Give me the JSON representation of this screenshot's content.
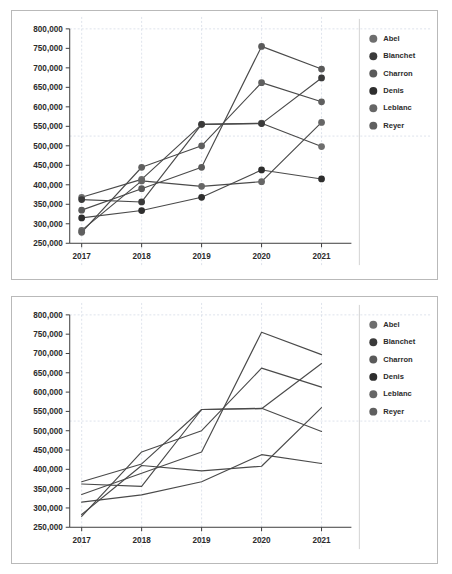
{
  "chart_data": [
    {
      "id": "top",
      "type": "line",
      "title": "",
      "xlabel": "",
      "ylabel": "",
      "marker_style": "circle",
      "markers_visible": true,
      "grid": true,
      "legend_position": "right",
      "categories": [
        "2017",
        "2018",
        "2019",
        "2020",
        "2021"
      ],
      "ylim": [
        250000,
        800000
      ],
      "yticks": [
        250000,
        300000,
        350000,
        400000,
        450000,
        500000,
        550000,
        600000,
        650000,
        700000,
        750000,
        800000
      ],
      "ytick_labels": [
        "250,000",
        "300,000",
        "350,000",
        "400,000",
        "450,000",
        "500,000",
        "550,000",
        "600,000",
        "650,000",
        "700,000",
        "750,000",
        "800,000"
      ],
      "series": [
        {
          "name": "Abel",
          "color": "#6e6e6e",
          "values": [
            368000,
            414000,
            555000,
            558000,
            498000
          ]
        },
        {
          "name": "Blanchet",
          "color": "#3a3a3a",
          "values": [
            362000,
            356000,
            555000,
            557000,
            674000
          ]
        },
        {
          "name": "Charron",
          "color": "#5a5a5a",
          "values": [
            335000,
            390000,
            445000,
            755000,
            697000
          ]
        },
        {
          "name": "Denis",
          "color": "#2e2e2e",
          "values": [
            315000,
            334000,
            368000,
            438000,
            415000
          ]
        },
        {
          "name": "Leblanc",
          "color": "#666666",
          "values": [
            283000,
            410000,
            396000,
            408000,
            560000
          ]
        },
        {
          "name": "Reyer",
          "color": "#5f5f5f",
          "values": [
            278000,
            445000,
            500000,
            662000,
            613000
          ]
        }
      ]
    },
    {
      "id": "bottom",
      "type": "line",
      "title": "",
      "xlabel": "",
      "ylabel": "",
      "marker_style": "none",
      "markers_visible": false,
      "grid": true,
      "legend_position": "right",
      "categories": [
        "2017",
        "2018",
        "2019",
        "2020",
        "2021"
      ],
      "ylim": [
        250000,
        800000
      ],
      "yticks": [
        250000,
        300000,
        350000,
        400000,
        450000,
        500000,
        550000,
        600000,
        650000,
        700000,
        750000,
        800000
      ],
      "ytick_labels": [
        "250,000",
        "300,000",
        "350,000",
        "400,000",
        "450,000",
        "500,000",
        "550,000",
        "600,000",
        "650,000",
        "700,000",
        "750,000",
        "800,000"
      ],
      "series": [
        {
          "name": "Abel",
          "color": "#6e6e6e",
          "values": [
            368000,
            414000,
            555000,
            558000,
            498000
          ]
        },
        {
          "name": "Blanchet",
          "color": "#3a3a3a",
          "values": [
            362000,
            356000,
            555000,
            557000,
            674000
          ]
        },
        {
          "name": "Charron",
          "color": "#5a5a5a",
          "values": [
            335000,
            390000,
            445000,
            755000,
            697000
          ]
        },
        {
          "name": "Denis",
          "color": "#2e2e2e",
          "values": [
            315000,
            334000,
            368000,
            438000,
            415000
          ]
        },
        {
          "name": "Leblanc",
          "color": "#666666",
          "values": [
            283000,
            410000,
            396000,
            408000,
            560000
          ]
        },
        {
          "name": "Reyer",
          "color": "#5f5f5f",
          "values": [
            278000,
            445000,
            500000,
            662000,
            613000
          ]
        }
      ]
    }
  ],
  "theme": {
    "background": "#ffffff",
    "border": "#b9b9b9",
    "axis": "#3c3c3c",
    "grid": "#cfd6e4",
    "text": "#2b2b2b",
    "line": "#4a4a4a"
  }
}
